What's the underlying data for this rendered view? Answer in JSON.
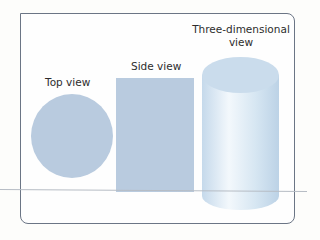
{
  "diagram": {
    "labels": {
      "top_view": "Top view",
      "side_view": "Side view",
      "three_d_line1": "Three-dimensional",
      "three_d_line2": "view"
    },
    "colors": {
      "shape_fill": "#b7c9de",
      "cylinder_light": "#eef5fb",
      "cylinder_mid": "#cde0ef",
      "frame_border": "#6b7585",
      "text": "#2d2d2d"
    }
  }
}
